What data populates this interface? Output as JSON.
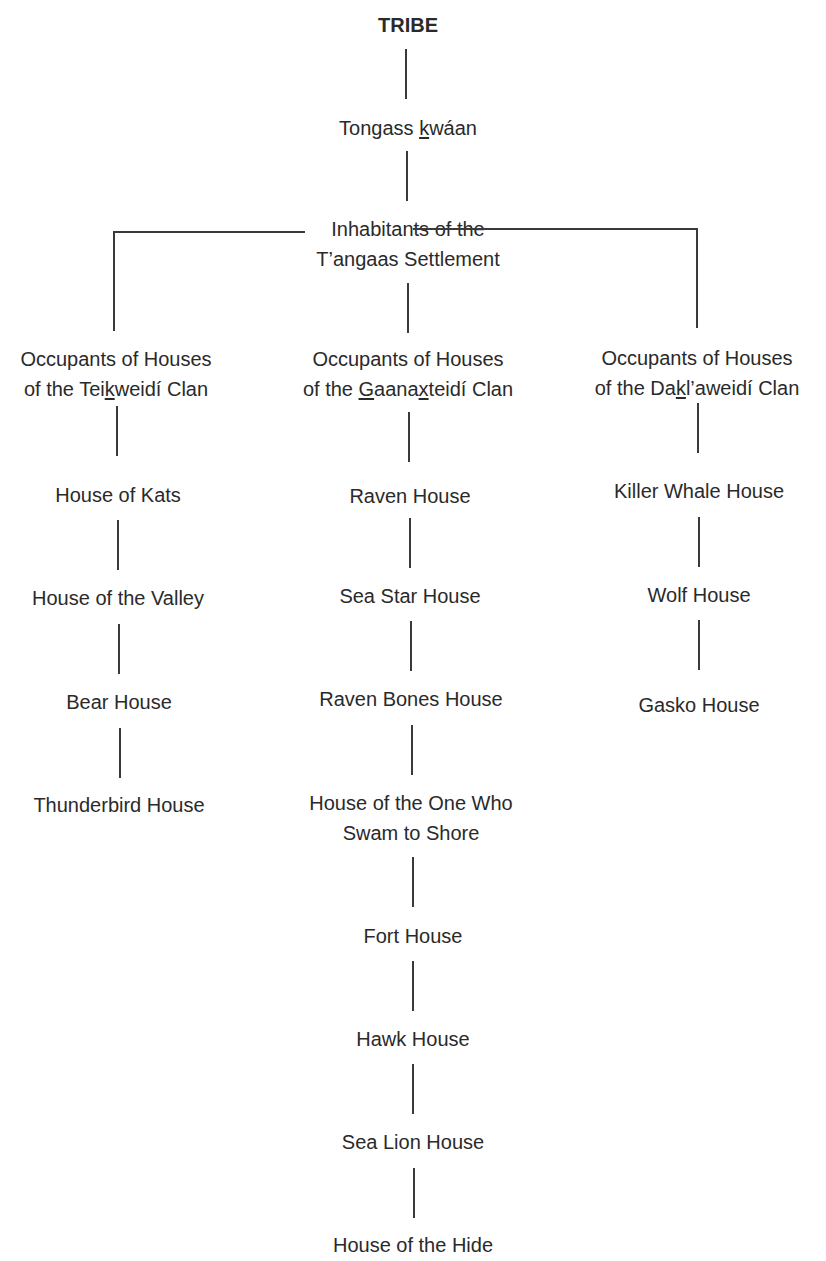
{
  "diagram": {
    "root": {
      "label": "TRIBE"
    },
    "level1": {
      "label": "Tongass kwáan",
      "underlined_char": "k"
    },
    "level2": {
      "line1": "Inhabitants of the",
      "line2": "T’angaas Settlement"
    },
    "clans": [
      {
        "line1": "Occupants of Houses",
        "line2_pre": "of the Tei",
        "line2_u": "k",
        "line2_post": "weidí Clan",
        "houses": [
          "House of Kats",
          "House of the Valley",
          "Bear House",
          "Thunderbird House"
        ]
      },
      {
        "line1": "Occupants of Houses",
        "line2_pre": "of the ",
        "line2_u": "G",
        "line2_mid": "aana",
        "line2_u2": "x",
        "line2_post": "teidí Clan",
        "houses": [
          "Raven House",
          "Sea Star House",
          "Raven Bones House",
          "House of the One Who|Swam to Shore",
          "Fort House",
          "Hawk House",
          "Sea Lion House",
          "House of the Hide"
        ],
        "houses_display": {
          "h3_line1": "House of the One Who",
          "h3_line2": "Swam to Shore"
        }
      },
      {
        "line1": "Occupants of Houses",
        "line2_pre": "of the Da",
        "line2_u": "k",
        "line2_post": "l’aweidí Clan",
        "houses": [
          "Killer Whale House",
          "Wolf House",
          "Gasko House"
        ]
      }
    ]
  },
  "colors": {
    "line": "#3a3a3a",
    "text": "#2a2a2a",
    "background": "#ffffff"
  }
}
